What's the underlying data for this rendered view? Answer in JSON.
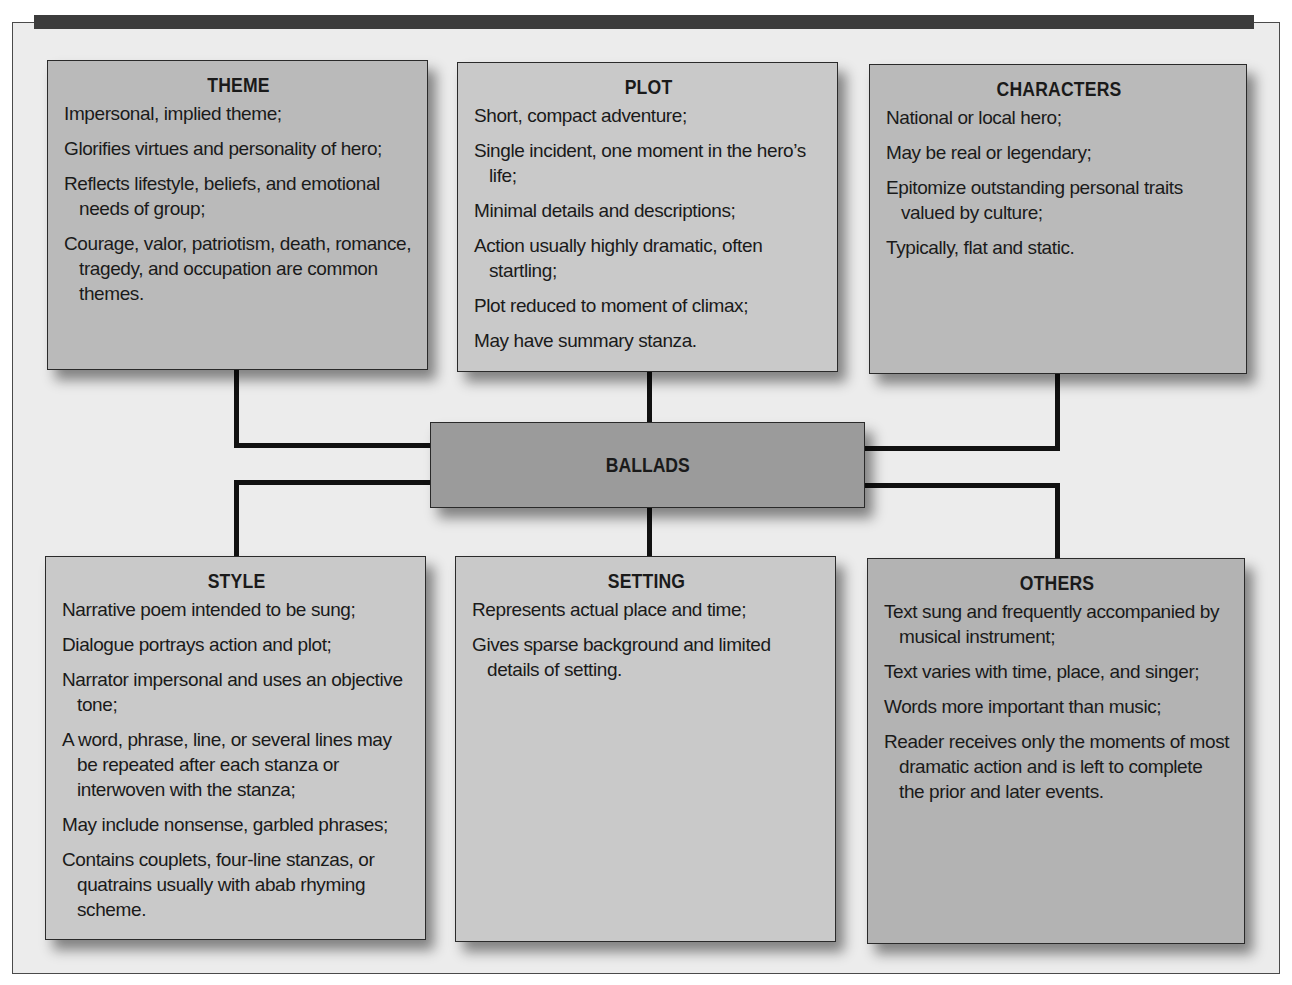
{
  "diagram": {
    "center": {
      "label": "BALLADS"
    },
    "colors": {
      "frame_background": "#ececec",
      "top_bar": "#3c3c3c",
      "center_box": "#9b9b9b",
      "box_light": "#c9c9c9",
      "box_mid": "#bababa",
      "box_dark": "#b3b3b3",
      "connector": "#111111"
    },
    "boxes": {
      "theme": {
        "title": "THEME",
        "items": [
          "Impersonal, implied theme;",
          "Glorifies virtues and personality of hero;",
          "Reflects lifestyle, beliefs, and emotional needs of group;",
          "Courage, valor, patriotism, death, romance, tragedy, and occupation are common themes."
        ]
      },
      "plot": {
        "title": "PLOT",
        "items": [
          "Short, compact adventure;",
          "Single incident, one moment in the hero’s life;",
          "Minimal details and descriptions;",
          "Action usually highly dramatic, often startling;",
          "Plot reduced to moment of climax;",
          "May have summary stanza."
        ]
      },
      "characters": {
        "title": "CHARACTERS",
        "items": [
          "National or local hero;",
          "May be real or legendary;",
          "Epitomize outstanding personal traits valued by culture;",
          "Typically, flat and static."
        ]
      },
      "style": {
        "title": "STYLE",
        "items": [
          "Narrative poem intended to be sung;",
          "Dialogue portrays action and plot;",
          "Narrator impersonal and uses an objective tone;",
          "A word, phrase, line, or several lines may be repeated after each stanza or interwoven with the stanza;",
          "May include nonsense, garbled phrases;",
          "Contains couplets, four-line stanzas, or quatrains usually with abab rhyming scheme."
        ]
      },
      "setting": {
        "title": "SETTING",
        "items": [
          "Represents actual place and time;",
          "Gives sparse background and limited details of setting."
        ]
      },
      "others": {
        "title": "OTHERS",
        "items": [
          "Text sung and frequently accompanied by musical instrument;",
          "Text varies with time, place, and singer;",
          "Words more important than music;",
          "Reader receives only the moments of most dramatic action and is left to complete the prior and later events."
        ]
      }
    }
  }
}
